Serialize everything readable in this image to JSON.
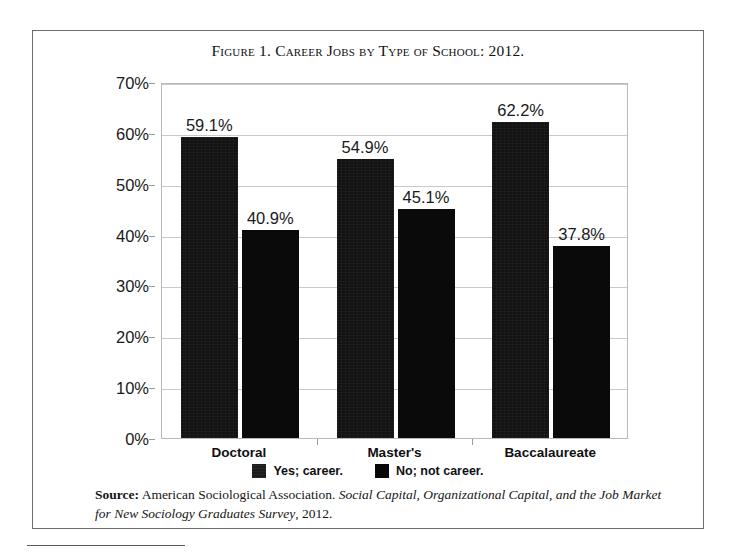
{
  "figure": {
    "title": "Figure 1. Career Jobs by Type of School: 2012."
  },
  "chart_data": {
    "type": "bar",
    "title": "Figure 1. Career Jobs by Type of School: 2012.",
    "xlabel": "",
    "ylabel": "",
    "ylim": [
      0,
      70
    ],
    "ytick_labels": [
      "0%",
      "10%",
      "20%",
      "30%",
      "40%",
      "50%",
      "60%",
      "70%"
    ],
    "ytick_values": [
      0,
      10,
      20,
      30,
      40,
      50,
      60,
      70
    ],
    "grid": true,
    "legend_position": "bottom",
    "categories": [
      "Doctoral",
      "Master's",
      "Baccalaureate"
    ],
    "series": [
      {
        "name": "Yes; career.",
        "color": "#121212",
        "values": [
          59.1,
          54.9,
          62.2
        ],
        "labels": [
          "59.1%",
          "54.9%",
          "62.2%"
        ]
      },
      {
        "name": "No; not career.",
        "color": "#0a0a0a",
        "values": [
          40.9,
          45.1,
          37.8
        ],
        "labels": [
          "40.9%",
          "45.1%",
          "37.8%"
        ]
      }
    ]
  },
  "legend": {
    "items": [
      {
        "label": "Yes; career.",
        "swatch": "legend-swatch-yes"
      },
      {
        "label": "No; not career.",
        "swatch": "legend-swatch-no"
      }
    ]
  },
  "source": {
    "label": "Source:",
    "organization": " American Sociological Association. ",
    "publication": "Social Capital, Organizational Capital, and the Job Market for New Sociology Graduates Survey",
    "year": ", 2012."
  }
}
